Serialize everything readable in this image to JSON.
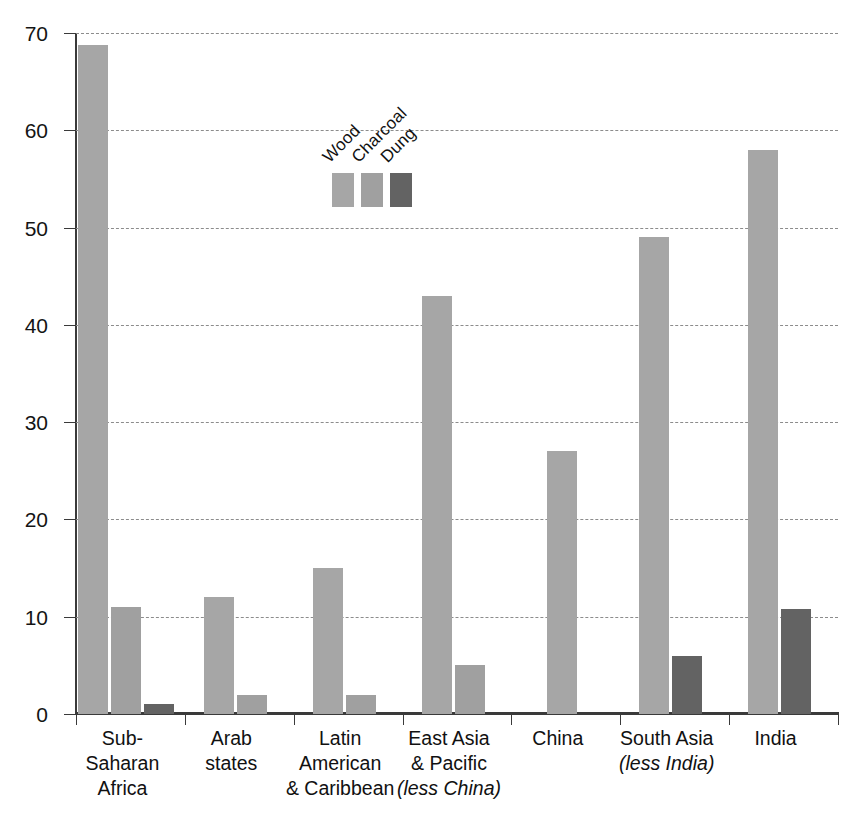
{
  "chart_data": {
    "type": "bar",
    "title": "",
    "subtitle": "",
    "xlabel": "",
    "ylabel": "Percentage",
    "ylim": [
      0,
      70
    ],
    "ytick_step": 10,
    "yticks": [
      "0",
      "10",
      "20",
      "30",
      "40",
      "50",
      "60",
      "70"
    ],
    "grid": true,
    "grid_style": "dashed horizontal",
    "legend_position": "inside upper-left area, labels rotated 45 degrees",
    "categories": [
      "Sub-Saharan Africa",
      "Arab states",
      "Latin American & Caribbean",
      "East Asia & Pacific (less China)",
      "China",
      "South Asia (less India)",
      "India"
    ],
    "category_lines": [
      [
        "Sub-Saharan",
        "Africa"
      ],
      [
        "Arab",
        "states"
      ],
      [
        "Latin American",
        "& Caribbean"
      ],
      [
        "East Asia",
        "& Pacific",
        "(less China)"
      ],
      [
        "China"
      ],
      [
        "South Asia",
        "(less India)"
      ],
      [
        "India"
      ]
    ],
    "category_italic_lines": [
      [
        false,
        false
      ],
      [
        false,
        false
      ],
      [
        false,
        false
      ],
      [
        false,
        false,
        true
      ],
      [
        false
      ],
      [
        false,
        true
      ],
      [
        false
      ]
    ],
    "series": [
      {
        "name": "Wood",
        "color": "#a6a6a6",
        "values": [
          68.8,
          12,
          15,
          43,
          27,
          49,
          58
        ]
      },
      {
        "name": "Charcoal",
        "color": "#a0a0a0",
        "values": [
          11,
          2,
          2,
          5,
          0,
          0,
          0
        ]
      },
      {
        "name": "Dung",
        "color": "#636363",
        "values": [
          1,
          0,
          0,
          0,
          0,
          6,
          10.8
        ]
      }
    ]
  },
  "legend": {
    "entries": [
      {
        "label": "Wood",
        "color": "#a6a6a6"
      },
      {
        "label": "Charcoal",
        "color": "#a0a0a0"
      },
      {
        "label": "Dung",
        "color": "#636363"
      }
    ]
  },
  "axis": {
    "y_title": "Percentage",
    "y_min": 0,
    "y_max": 70
  },
  "colors": {
    "wood": "#a6a6a6",
    "charcoal": "#a0a0a0",
    "dung": "#636363",
    "axis": "#3a3a3a",
    "grid": "#8c8c8c",
    "text": "#111111",
    "background": "#ffffff"
  }
}
